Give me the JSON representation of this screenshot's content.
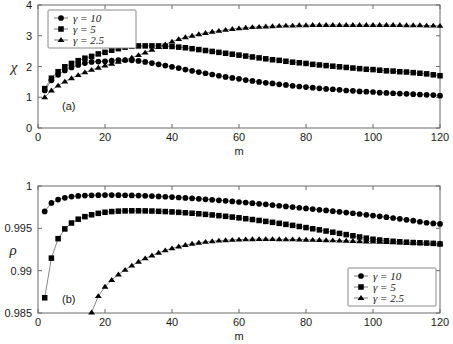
{
  "figure": {
    "background_color": "#ffffff",
    "marker_color": "#000000",
    "line_color": "#555555",
    "axis_color": "#6b6b6b"
  },
  "panels": [
    {
      "tag": "(a)",
      "ylabel": "χ",
      "xlabel": "m",
      "legend_position": "top-left"
    },
    {
      "tag": "(b)",
      "ylabel": "ρ",
      "xlabel": "m",
      "legend_position": "bottom-right"
    }
  ],
  "legend": {
    "entries": [
      {
        "label": "γ = 10",
        "gamma": "γ",
        "rest": " = 10",
        "marker": "circle"
      },
      {
        "label": "γ = 5",
        "gamma": "γ",
        "rest": " = 5",
        "marker": "square"
      },
      {
        "label": "γ = 2.5",
        "gamma": "γ",
        "rest": " = 2.5",
        "marker": "triangle"
      }
    ]
  },
  "chart_data": [
    {
      "type": "line",
      "title": "",
      "panel": "(a)",
      "xlabel": "m",
      "ylabel": "χ",
      "xlim": [
        0,
        120
      ],
      "ylim": [
        0,
        4
      ],
      "xticks": [
        0,
        20,
        40,
        60,
        80,
        100,
        120
      ],
      "yticks": [
        0,
        1,
        2,
        3,
        4
      ],
      "xtick_labels": [
        "0",
        "20",
        "40",
        "60",
        "80",
        "100",
        "120"
      ],
      "ytick_labels": [
        "0",
        "1",
        "2",
        "3",
        "4"
      ],
      "grid": false,
      "legend_position": "upper left",
      "annotations": [
        "(a)"
      ],
      "x": [
        2,
        4,
        6,
        8,
        10,
        12,
        14,
        16,
        18,
        20,
        22,
        24,
        26,
        28,
        30,
        32,
        34,
        36,
        38,
        40,
        42,
        44,
        46,
        48,
        50,
        52,
        54,
        56,
        58,
        60,
        62,
        64,
        66,
        68,
        70,
        72,
        74,
        76,
        78,
        80,
        82,
        84,
        86,
        88,
        90,
        92,
        94,
        96,
        98,
        100,
        102,
        104,
        106,
        108,
        110,
        112,
        114,
        116,
        118,
        120
      ],
      "series": [
        {
          "name": "γ = 10",
          "marker": "circle",
          "values": [
            1.22,
            1.55,
            1.73,
            1.87,
            1.97,
            2.05,
            2.11,
            2.15,
            2.16,
            2.17,
            2.19,
            2.21,
            2.21,
            2.2,
            2.18,
            2.15,
            2.11,
            2.07,
            2.03,
            1.99,
            1.95,
            1.9,
            1.86,
            1.82,
            1.78,
            1.74,
            1.7,
            1.66,
            1.63,
            1.6,
            1.56,
            1.53,
            1.5,
            1.47,
            1.45,
            1.42,
            1.4,
            1.37,
            1.35,
            1.33,
            1.31,
            1.29,
            1.27,
            1.26,
            1.24,
            1.22,
            1.21,
            1.19,
            1.18,
            1.17,
            1.15,
            1.14,
            1.13,
            1.12,
            1.11,
            1.1,
            1.09,
            1.08,
            1.07,
            1.05
          ]
        },
        {
          "name": "γ = 5",
          "marker": "square",
          "values": [
            1.28,
            1.62,
            1.83,
            1.99,
            2.1,
            2.19,
            2.27,
            2.33,
            2.41,
            2.46,
            2.53,
            2.58,
            2.63,
            2.66,
            2.67,
            2.67,
            2.67,
            2.67,
            2.66,
            2.65,
            2.63,
            2.61,
            2.58,
            2.55,
            2.52,
            2.49,
            2.46,
            2.43,
            2.4,
            2.37,
            2.34,
            2.31,
            2.28,
            2.25,
            2.22,
            2.2,
            2.17,
            2.14,
            2.12,
            2.1,
            2.07,
            2.05,
            2.03,
            2.01,
            1.99,
            1.97,
            1.95,
            1.93,
            1.91,
            1.9,
            1.88,
            1.86,
            1.85,
            1.83,
            1.82,
            1.8,
            1.78,
            1.76,
            1.73,
            1.7
          ]
        },
        {
          "name": "γ = 2.5",
          "marker": "triangle",
          "values": [
            1.0,
            1.22,
            1.38,
            1.51,
            1.62,
            1.72,
            1.81,
            1.89,
            1.96,
            2.03,
            2.09,
            2.15,
            2.21,
            2.29,
            2.37,
            2.45,
            2.54,
            2.63,
            2.72,
            2.81,
            2.89,
            2.95,
            3.0,
            3.05,
            3.09,
            3.13,
            3.16,
            3.19,
            3.22,
            3.24,
            3.26,
            3.28,
            3.29,
            3.3,
            3.31,
            3.32,
            3.33,
            3.33,
            3.34,
            3.34,
            3.35,
            3.35,
            3.35,
            3.35,
            3.35,
            3.35,
            3.35,
            3.35,
            3.35,
            3.35,
            3.35,
            3.35,
            3.35,
            3.35,
            3.34,
            3.34,
            3.34,
            3.33,
            3.33,
            3.32
          ]
        }
      ]
    },
    {
      "type": "line",
      "title": "",
      "panel": "(b)",
      "xlabel": "m",
      "ylabel": "ρ",
      "xlim": [
        0,
        120
      ],
      "ylim": [
        0.985,
        1.0
      ],
      "xticks": [
        0,
        20,
        40,
        60,
        80,
        100,
        120
      ],
      "yticks": [
        0.985,
        0.99,
        0.995,
        1
      ],
      "xtick_labels": [
        "0",
        "20",
        "40",
        "60",
        "80",
        "100",
        "120"
      ],
      "ytick_labels": [
        "0.985",
        "0.99",
        "0.995",
        "1"
      ],
      "grid": false,
      "legend_position": "lower right",
      "annotations": [
        "(b)"
      ],
      "x": [
        2,
        4,
        6,
        8,
        10,
        12,
        14,
        16,
        18,
        20,
        22,
        24,
        26,
        28,
        30,
        32,
        34,
        36,
        38,
        40,
        42,
        44,
        46,
        48,
        50,
        52,
        54,
        56,
        58,
        60,
        62,
        64,
        66,
        68,
        70,
        72,
        74,
        76,
        78,
        80,
        82,
        84,
        86,
        88,
        90,
        92,
        94,
        96,
        98,
        100,
        102,
        104,
        106,
        108,
        110,
        112,
        114,
        116,
        118,
        120
      ],
      "series": [
        {
          "name": "γ = 10",
          "marker": "circle",
          "values": [
            0.997,
            0.998,
            0.9984,
            0.9986,
            0.99875,
            0.99883,
            0.99887,
            0.9989,
            0.99892,
            0.99893,
            0.99893,
            0.99892,
            0.99891,
            0.99889,
            0.99887,
            0.99884,
            0.99881,
            0.99877,
            0.99873,
            0.99869,
            0.99864,
            0.99859,
            0.99854,
            0.99849,
            0.99843,
            0.99837,
            0.99831,
            0.99825,
            0.99818,
            0.99811,
            0.99804,
            0.99797,
            0.9979,
            0.99783,
            0.99775,
            0.99767,
            0.99759,
            0.99751,
            0.99743,
            0.99735,
            0.99727,
            0.99719,
            0.99711,
            0.99703,
            0.99695,
            0.99686,
            0.99678,
            0.99669,
            0.9966,
            0.99651,
            0.99642,
            0.99632,
            0.99622,
            0.99612,
            0.99601,
            0.9959,
            0.99578,
            0.99566,
            0.99558,
            0.99552
          ]
        },
        {
          "name": "γ = 5",
          "marker": "square",
          "values": [
            0.9868,
            0.99148,
            0.99378,
            0.99493,
            0.99563,
            0.99608,
            0.99638,
            0.9966,
            0.99677,
            0.9969,
            0.99698,
            0.99703,
            0.99706,
            0.99707,
            0.99707,
            0.99706,
            0.99704,
            0.99701,
            0.99698,
            0.99694,
            0.99689,
            0.99684,
            0.99678,
            0.99672,
            0.99665,
            0.99658,
            0.9965,
            0.99642,
            0.99633,
            0.99624,
            0.99614,
            0.99604,
            0.99593,
            0.99582,
            0.99571,
            0.99559,
            0.99547,
            0.99535,
            0.99522,
            0.99509,
            0.99495,
            0.99482,
            0.99468,
            0.99454,
            0.9944,
            0.99426,
            0.99412,
            0.99398,
            0.99384,
            0.99371,
            0.99362,
            0.99354,
            0.99347,
            0.99341,
            0.99336,
            0.99332,
            0.99329,
            0.99326,
            0.99322,
            0.99315
          ]
        },
        {
          "name": "γ = 2.5",
          "marker": "triangle",
          "values": [
            null,
            null,
            null,
            null,
            null,
            null,
            null,
            0.98506,
            0.987,
            0.9881,
            0.9889,
            0.98955,
            0.9901,
            0.9906,
            0.99105,
            0.99145,
            0.9918,
            0.99212,
            0.9924,
            0.99264,
            0.99285,
            0.99303,
            0.99318,
            0.9933,
            0.9934,
            0.99348,
            0.99355,
            0.9936,
            0.99364,
            0.99367,
            0.99369,
            0.99371,
            0.99372,
            0.99372,
            0.99372,
            0.99371,
            0.9937,
            0.99369,
            0.99368,
            0.99366,
            0.99364,
            0.99362,
            0.9936,
            0.99358,
            0.99355,
            0.99353,
            0.9935,
            0.99348,
            0.99345,
            0.99343,
            0.9934,
            0.99338,
            0.99336,
            0.99334,
            0.99332,
            0.9933,
            0.99328,
            0.99326,
            0.99324,
            0.99322
          ]
        }
      ]
    }
  ]
}
